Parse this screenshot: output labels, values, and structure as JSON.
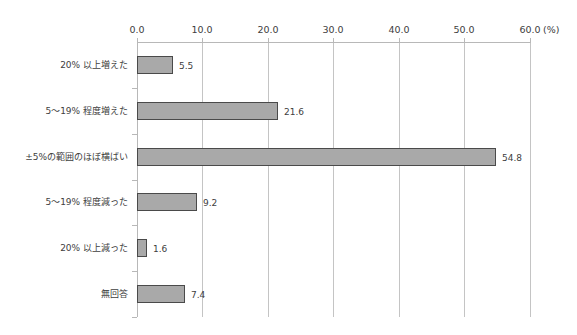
{
  "chart_data": {
    "type": "bar",
    "orientation": "horizontal",
    "title": "",
    "xlabel": "",
    "ylabel": "",
    "unit_label": "(%)",
    "xlim": [
      0,
      60
    ],
    "x_ticks": [
      "0.0",
      "10.0",
      "20.0",
      "30.0",
      "40.0",
      "50.0",
      "60.0"
    ],
    "x_axis_position": "top",
    "grid": true,
    "legend": null,
    "categories": [
      "20% 以上増えた",
      "5～19% 程度増えた",
      "±5%の範囲のほぼ横ばい",
      "5～19% 程度減った",
      "20% 以上減った",
      "無回答"
    ],
    "values": [
      5.5,
      21.6,
      54.8,
      9.2,
      1.6,
      7.4
    ],
    "value_labels": [
      "5.5",
      "21.6",
      "54.8",
      "9.2",
      "1.6",
      "7.4"
    ],
    "colors": {
      "bar_fill": "#a9a9a9",
      "bar_border": "#4a4a4a",
      "grid": "#c4c4c4"
    }
  }
}
